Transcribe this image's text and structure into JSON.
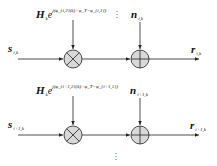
{
  "diagram": {
    "type": "signal flow block diagram",
    "colors": {
      "line": "#222222",
      "node_fill": "#d8d8d8",
      "background": "#ffffff"
    },
    "rows": [
      {
        "input": {
          "symbol": "s",
          "subscript": "i,k"
        },
        "multiplier": {
          "symbol": "H",
          "subscript": "k",
          "exp_base": "e",
          "exponent": "j(φ_{i,2}(k)+φ_T−φ_{i,1})",
          "operator": "multiply"
        },
        "noise": {
          "symbol": "n",
          "subscript": "i,k"
        },
        "adder": {
          "operator": "add"
        },
        "output": {
          "symbol": "r",
          "subscript": "i,k"
        }
      },
      {
        "input": {
          "symbol": "s",
          "subscript": "i+1,k"
        },
        "multiplier": {
          "symbol": "H",
          "subscript": "k",
          "exp_base": "e",
          "exponent": "j(φ_{i+1,2}(k)+φ_T−φ_{i+1,1})",
          "operator": "multiply"
        },
        "noise": {
          "symbol": "n",
          "subscript": "i+1,k"
        },
        "adder": {
          "operator": "add"
        },
        "output": {
          "symbol": "r",
          "subscript": "i+1,k"
        }
      }
    ],
    "ellipsis": "⋮"
  }
}
